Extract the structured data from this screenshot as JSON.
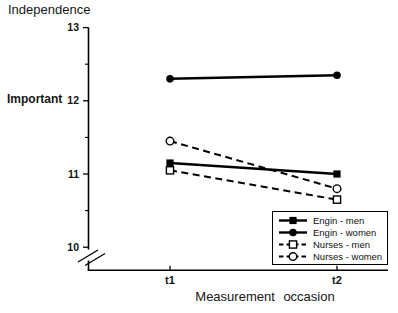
{
  "chart_data": {
    "type": "line",
    "title": "Independence",
    "ylabel": "Important",
    "xlabel": "Measurement occasion",
    "categories": [
      "t1",
      "t2"
    ],
    "series": [
      {
        "name": "Engin - men",
        "line": "solid",
        "marker": "filled-square",
        "color": "#000000",
        "values": [
          11.15,
          11.0
        ]
      },
      {
        "name": "Engin - women",
        "line": "solid",
        "marker": "filled-circle",
        "color": "#000000",
        "values": [
          12.3,
          12.35
        ]
      },
      {
        "name": "Nurses - men",
        "line": "dashed",
        "marker": "open-square",
        "color": "#000000",
        "values": [
          11.05,
          10.65
        ]
      },
      {
        "name": "Nurses - women",
        "line": "dashed",
        "marker": "open-circle",
        "color": "#000000",
        "values": [
          11.45,
          10.8
        ]
      }
    ],
    "ylim": [
      10,
      13
    ],
    "y_major_ticks": [
      13,
      12,
      11,
      10
    ],
    "y_minor_ticks": [
      12.5,
      11.5,
      10.5
    ],
    "axis_break_below": 10,
    "grid": false,
    "legend_position": "bottom-right",
    "background": "#ffffff",
    "ink_color": "#000000"
  }
}
